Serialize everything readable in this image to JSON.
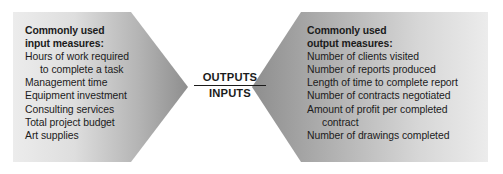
{
  "diagram": {
    "background_color": "#ffffff",
    "text_color": "#1b1b1b",
    "arrow_gradient_light": "#e9e9e9",
    "arrow_gradient_dark": "#8f8f8f",
    "ratio": {
      "numerator": "OUTPUTS",
      "denominator": "INPUTS"
    },
    "input_panel": {
      "heading_line1": "Commonly used",
      "heading_line2": "input measures:",
      "items": [
        {
          "text": "Hours of work required",
          "indent": false
        },
        {
          "text": "to complete a task",
          "indent": true
        },
        {
          "text": "Management time",
          "indent": false
        },
        {
          "text": "Equipment investment",
          "indent": false
        },
        {
          "text": "Consulting services",
          "indent": false
        },
        {
          "text": "Total project budget",
          "indent": false
        },
        {
          "text": "Art supplies",
          "indent": false
        }
      ]
    },
    "output_panel": {
      "heading_line1": "Commonly used",
      "heading_line2": "output measures:",
      "items": [
        {
          "text": "Number of clients visited",
          "indent": false
        },
        {
          "text": "Number of reports produced",
          "indent": false
        },
        {
          "text": "Length of time to complete report",
          "indent": false
        },
        {
          "text": "Number of contracts negotiated",
          "indent": false
        },
        {
          "text": "Amount of profit per completed",
          "indent": false
        },
        {
          "text": "contract",
          "indent": true
        },
        {
          "text": "Number of drawings completed",
          "indent": false
        }
      ]
    }
  }
}
